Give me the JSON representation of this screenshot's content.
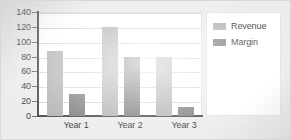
{
  "chart_data": {
    "type": "bar",
    "title": "",
    "xlabel": "",
    "ylabel": "",
    "categories": [
      "Year 1",
      "Year 2",
      "Year 3"
    ],
    "series": [
      {
        "name": "Revenue",
        "values": [
          88,
          120,
          80
        ],
        "color": "#b4b4b5"
      },
      {
        "name": "Margin",
        "values": [
          29,
          80,
          12
        ],
        "color": "#818182"
      }
    ],
    "ylim": [
      0,
      140
    ],
    "yticks": [
      0,
      20,
      40,
      60,
      80,
      100,
      120,
      140
    ],
    "ytick_labels": [
      "0",
      "20",
      "40",
      "60",
      "80",
      "100",
      "120",
      "140"
    ],
    "grid": true,
    "grid_axis": "y",
    "legend_position": "right",
    "legend_entries": [
      "Revenue",
      "Margin"
    ]
  },
  "axes": {
    "y_labels": [
      "140",
      "120",
      "100",
      "80",
      "60",
      "40",
      "20",
      "0"
    ],
    "x_labels": [
      "Year 1",
      "Year 2",
      "Year 3"
    ]
  },
  "legend": {
    "items": [
      {
        "label": "Revenue"
      },
      {
        "label": "Margin"
      }
    ]
  },
  "colors": {
    "revenue": "#b4b4b5",
    "margin": "#818182",
    "plot_background": "#ffffff",
    "figure_background": "#ececed",
    "axis": "#4c4c4d",
    "gridline": "#d6d6d7"
  }
}
